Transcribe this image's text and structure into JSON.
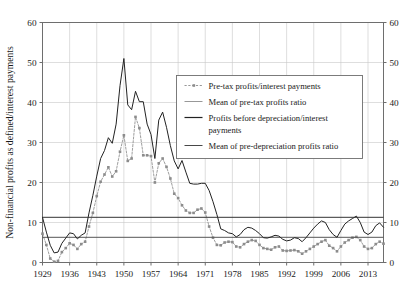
{
  "chart_data": {
    "type": "line",
    "title": "",
    "xlabel": "",
    "ylabel": "Non-financial profits as defined/interest payments",
    "xlim": [
      1929,
      2017
    ],
    "ylim": [
      0,
      60
    ],
    "ytick_values": [
      0,
      10,
      20,
      30,
      40,
      50,
      60
    ],
    "ytick_labels": [
      "0",
      "10",
      "20",
      "30",
      "40",
      "50",
      "60"
    ],
    "ytick_labels_right": [
      "0",
      "10",
      "20",
      "30",
      "40",
      "50",
      "60"
    ],
    "xtick_values": [
      1929,
      1936,
      1943,
      1950,
      1957,
      1964,
      1971,
      1978,
      1985,
      1992,
      1999,
      2006,
      2013
    ],
    "xtick_labels": [
      "1929",
      "1936",
      "1943",
      "1950",
      "1957",
      "1964",
      "1971",
      "1978",
      "1985",
      "1992",
      "1999",
      "2006",
      "2013"
    ],
    "grid": true,
    "grid_color": "#c8c8c8",
    "legend_position": "upper-center-right",
    "x": [
      1929,
      1930,
      1931,
      1932,
      1933,
      1934,
      1935,
      1936,
      1937,
      1938,
      1939,
      1940,
      1941,
      1942,
      1943,
      1944,
      1945,
      1946,
      1947,
      1948,
      1949,
      1950,
      1951,
      1952,
      1953,
      1954,
      1955,
      1956,
      1957,
      1958,
      1959,
      1960,
      1961,
      1962,
      1963,
      1964,
      1965,
      1966,
      1967,
      1968,
      1969,
      1970,
      1971,
      1972,
      1973,
      1974,
      1975,
      1976,
      1977,
      1978,
      1979,
      1980,
      1981,
      1982,
      1983,
      1984,
      1985,
      1986,
      1987,
      1988,
      1989,
      1990,
      1991,
      1992,
      1993,
      1994,
      1995,
      1996,
      1997,
      1998,
      1999,
      2000,
      2001,
      2002,
      2003,
      2004,
      2005,
      2006,
      2007,
      2008,
      2009,
      2010,
      2011,
      2012,
      2013,
      2014,
      2015,
      2016,
      2017
    ],
    "series": [
      {
        "name": "Pre-tax profits/interest payments",
        "style": "dashed-with-square-markers",
        "color": "#8c8c8c",
        "marker": "square",
        "values": [
          7.2,
          4.4,
          1.0,
          0.2,
          0.4,
          2.6,
          3.6,
          4.8,
          4.4,
          3.4,
          4.6,
          5.2,
          9.0,
          12.4,
          16.6,
          20.2,
          22.0,
          23.8,
          21.5,
          22.8,
          27.7,
          31.8,
          25.4,
          26.0,
          36.4,
          33.6,
          26.8,
          26.8,
          26.6,
          20.0,
          24.8,
          26.0,
          23.9,
          21.0,
          17.2,
          16.1,
          14.3,
          13.0,
          12.4,
          12.4,
          13.2,
          13.5,
          12.5,
          9.0,
          6.2,
          4.4,
          4.3,
          5.0,
          5.2,
          5.1,
          4.0,
          3.8,
          4.6,
          5.2,
          5.6,
          5.4,
          4.4,
          3.6,
          3.4,
          3.2,
          3.8,
          4.0,
          3.0,
          2.9,
          3.0,
          3.1,
          2.8,
          2.2,
          2.8,
          3.4,
          4.0,
          4.6,
          5.2,
          5.6,
          4.2,
          3.6,
          2.8,
          4.0,
          5.0,
          5.6,
          6.2,
          6.4,
          5.6,
          4.0,
          3.4,
          3.6,
          4.6,
          5.2,
          4.7
        ]
      },
      {
        "name": "Mean of pre-tax profits ratio",
        "style": "horizontal-mean-line",
        "color": "#555555",
        "value": 6.3
      },
      {
        "name": "Profits before depreciation/interest payments",
        "style": "solid",
        "color": "#222222",
        "values": [
          11.3,
          7.6,
          4.3,
          2.4,
          2.6,
          4.8,
          6.1,
          7.4,
          7.2,
          5.9,
          6.8,
          7.4,
          12.4,
          16.8,
          21.6,
          26.0,
          28.0,
          31.2,
          29.8,
          34.6,
          44.2,
          51.0,
          39.4,
          38.2,
          42.8,
          40.2,
          40.2,
          34.6,
          32.0,
          26.0,
          35.6,
          37.6,
          33.8,
          29.2,
          25.4,
          23.4,
          25.5,
          22.6,
          19.8,
          19.6,
          19.6,
          19.8,
          19.8,
          18.0,
          15.2,
          12.0,
          8.4,
          8.0,
          7.4,
          7.2,
          6.4,
          7.0,
          8.2,
          8.8,
          8.6,
          8.0,
          7.2,
          6.2,
          6.1,
          6.4,
          6.8,
          6.6,
          5.8,
          5.4,
          5.6,
          6.2,
          6.0,
          5.2,
          6.2,
          7.4,
          8.6,
          9.6,
          10.4,
          10.0,
          8.2,
          7.0,
          6.3,
          8.0,
          9.6,
          10.4,
          11.0,
          11.6,
          10.0,
          7.6,
          7.0,
          7.6,
          9.2,
          9.9,
          8.8
        ]
      },
      {
        "name": "Mean of pre-depreciation profits ratio",
        "style": "horizontal-mean-line",
        "color": "#333333",
        "value": 11.3
      }
    ]
  },
  "legend": {
    "entries": [
      {
        "label": "Pre-tax profits/interest payments"
      },
      {
        "label": "Mean of pre-tax profits ratio"
      },
      {
        "label": "Profits before depreciation/interest"
      },
      {
        "label": "payments"
      },
      {
        "label": "Mean of pre-depreciation profits ratio"
      }
    ]
  }
}
